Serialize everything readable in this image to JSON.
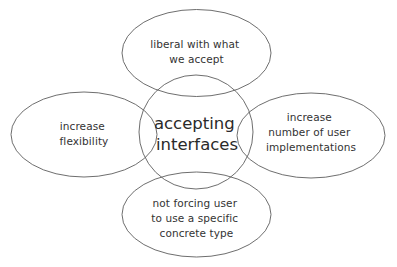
{
  "diagram": {
    "title": "accepting interfaces",
    "colors": {
      "background": "#ffffff",
      "outline": "#5e5e5e",
      "text": "#333333",
      "center_text": "#2a2a2a"
    },
    "center": {
      "lines": [
        "accepting",
        "interfaces"
      ]
    },
    "nodes": {
      "top": {
        "lines": [
          "liberal with what",
          "we accept"
        ]
      },
      "left": {
        "lines": [
          "increase",
          "flexibility"
        ]
      },
      "right": {
        "lines": [
          "increase",
          "number of user",
          "implementations"
        ]
      },
      "bottom": {
        "lines": [
          "not forcing user",
          "to use a specific",
          "concrete type"
        ]
      }
    }
  }
}
